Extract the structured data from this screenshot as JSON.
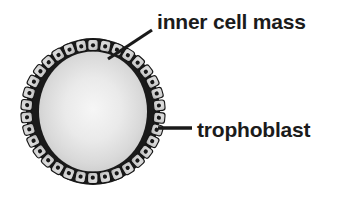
{
  "figure": {
    "name": "blastocyst-diagram",
    "background_color": "#ffffff",
    "labels": {
      "inner_cell_mass": "inner cell mass",
      "trophoblast": "trophoblast"
    },
    "colors": {
      "text": "#1b1b1b",
      "outline_dark": "#1a1a1a",
      "cell_fill_light": "#d8d8d8",
      "cavity_center": "#f2f2f2",
      "cavity_edge": "#cfcfcf",
      "inner_cell_mass_fill": "#1c1c1c",
      "leader_line": "#1a1a1a"
    },
    "structures": [
      {
        "name": "trophoblast",
        "description": "single outer ring of cuboidal cells forming the blastocyst wall",
        "cell_count": 34
      },
      {
        "name": "inner-cell-mass",
        "description": "dark cluster of cells at the upper pole inside the cavity"
      },
      {
        "name": "blastocoel",
        "description": "light gray fluid-filled cavity"
      }
    ],
    "leader_lines": [
      {
        "name": "inner-cell-mass-leader",
        "from": [
          108,
          58
        ],
        "to": [
          152,
          30
        ]
      },
      {
        "name": "trophoblast-leader",
        "from": [
          158,
          128
        ],
        "to": [
          192,
          128
        ]
      }
    ]
  }
}
